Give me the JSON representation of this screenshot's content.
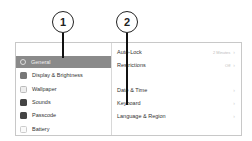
{
  "callouts": [
    {
      "number": "1"
    },
    {
      "number": "2"
    }
  ],
  "sidebar": {
    "items": [
      {
        "label": "General",
        "icon": "gear-icon",
        "selected": true
      },
      {
        "label": "Display & Brightness",
        "icon": "display-icon",
        "selected": false
      },
      {
        "label": "Wallpaper",
        "icon": "wallpaper-icon",
        "selected": false
      },
      {
        "label": "Sounds",
        "icon": "speaker-icon",
        "selected": false
      },
      {
        "label": "Passcode",
        "icon": "lock-icon",
        "selected": false
      },
      {
        "label": "Battery",
        "icon": "battery-icon",
        "selected": false
      }
    ]
  },
  "detail": {
    "items": [
      {
        "label": "Auto-Lock",
        "value": "2 Minutes",
        "chevron": "›"
      },
      {
        "label": "Restrictions",
        "value": "Off",
        "chevron": "›"
      },
      {
        "label": "Date & Time",
        "value": "",
        "chevron": "›"
      },
      {
        "label": "Keyboard",
        "value": "",
        "chevron": "›"
      },
      {
        "label": "Language & Region",
        "value": "",
        "chevron": "›"
      }
    ]
  },
  "colors": {
    "selected_bg": "#8a8a8a",
    "callout_stroke": "#222222"
  }
}
